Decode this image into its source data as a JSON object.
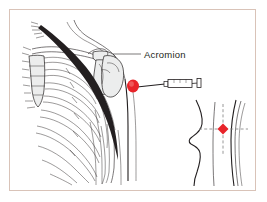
{
  "figure": {
    "name": "deltoid-intramuscular-injection-site",
    "frame_color": "#d9c3b8",
    "background_color": "#ffffff",
    "ink_color": "#231f20",
    "bone_shade_color": "#eceded",
    "marker_color": "#e8242a",
    "guide_color": "#8c8c8c"
  },
  "labels": {
    "acromion": "Acromion"
  },
  "main_view": {
    "name": "anterior-shoulder-skeletal-view",
    "parts": [
      "clavicle",
      "scapula",
      "acromion",
      "humerus-head",
      "rib-cage",
      "sternum",
      "costal-cartilage",
      "deltoid-muscle-band",
      "arm-contour"
    ]
  },
  "syringe": {
    "name": "syringe",
    "parts": [
      "needle",
      "barrel",
      "flange",
      "plunger-cap"
    ],
    "points_to": "injection-site"
  },
  "injection_site": {
    "name": "injection-site-marker",
    "color": "#e8242a",
    "location": "deltoid"
  },
  "inset_view": {
    "name": "lateral-body-landmark-inset",
    "parts": [
      "torso-profile",
      "arm-profile",
      "horizontal-guide",
      "vertical-guide",
      "injection-marker"
    ],
    "marker_color": "#e8242a",
    "guide_style": "dashed"
  }
}
